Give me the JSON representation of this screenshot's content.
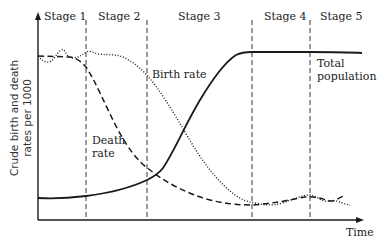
{
  "diagram": {
    "y_axis_label_line1": "Crude birth and death",
    "y_axis_label_line2": "rates per 1000",
    "x_axis_label": "Time",
    "stages": [
      {
        "label": "Stage 1"
      },
      {
        "label": "Stage 2"
      },
      {
        "label": "Stage 3"
      },
      {
        "label": "Stage 4"
      },
      {
        "label": "Stage 5"
      }
    ],
    "curves": {
      "birth_rate": {
        "label": "Birth rate",
        "style": "dotted"
      },
      "death_rate": {
        "label_line1": "Death",
        "label_line2": "rate",
        "style": "dashed"
      },
      "total_population": {
        "label_line1": "Total",
        "label_line2": "population",
        "style": "solid"
      }
    },
    "colors": {
      "line": "#1a1a1a",
      "text": "#222222",
      "background": "#ffffff"
    }
  }
}
